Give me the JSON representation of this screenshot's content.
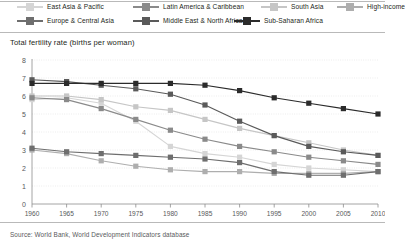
{
  "chart_title": "Total fertility rate (births per woman)",
  "source_note": "Source: World Bank, World Development Indicators database",
  "legend": {
    "items": [
      {
        "label": "East Asia & Pacific",
        "color": "#d5d5d5"
      },
      {
        "label": "Latin America & Caribbean",
        "color": "#8a8a8a"
      },
      {
        "label": "South Asia",
        "color": "#c6c6c6"
      },
      {
        "label": "High-income",
        "color": "#aeaeae"
      },
      {
        "label": "Europe & Central Asia",
        "color": "#6e6e6e"
      },
      {
        "label": "Middle East & North Africa",
        "color": "#5a5a5a"
      },
      {
        "label": "Sub-Saharan Africa",
        "color": "#2b2b2b"
      }
    ]
  },
  "chart_data": {
    "type": "line",
    "title": "Total fertility rate (births per woman)",
    "xlabel": "",
    "ylabel": "Total fertility rate (births per woman)",
    "xlim": [
      1960,
      2010
    ],
    "ylim": [
      0,
      8
    ],
    "yticks": [
      0,
      1,
      2,
      3,
      4,
      5,
      6,
      7,
      8
    ],
    "grid": true,
    "legend_position": "top",
    "x": [
      1960,
      1965,
      1970,
      1975,
      1980,
      1985,
      1990,
      1995,
      2000,
      2005,
      2010
    ],
    "categories": [
      "1960",
      "1965",
      "1970",
      "1975",
      "1980",
      "1985",
      "1990",
      "1995",
      "2000",
      "2005",
      "2010"
    ],
    "series": [
      {
        "name": "East Asia & Pacific",
        "color": "#d5d5d5",
        "values": [
          5.8,
          5.9,
          5.6,
          4.6,
          3.2,
          2.8,
          2.6,
          2.2,
          2.0,
          1.9,
          1.8
        ]
      },
      {
        "name": "Latin America & Caribbean",
        "color": "#8a8a8a",
        "values": [
          5.9,
          5.8,
          5.3,
          4.7,
          4.1,
          3.6,
          3.2,
          2.9,
          2.6,
          2.4,
          2.2
        ]
      },
      {
        "name": "South Asia",
        "color": "#c6c6c6",
        "values": [
          6.0,
          6.0,
          5.8,
          5.4,
          5.2,
          4.7,
          4.2,
          3.8,
          3.4,
          3.0,
          2.7
        ]
      },
      {
        "name": "High-income",
        "color": "#aeaeae",
        "values": [
          3.0,
          2.8,
          2.4,
          2.1,
          1.9,
          1.8,
          1.8,
          1.7,
          1.7,
          1.7,
          1.8
        ]
      },
      {
        "name": "Europe & Central Asia",
        "color": "#6e6e6e",
        "values": [
          3.1,
          2.9,
          2.8,
          2.7,
          2.6,
          2.5,
          2.3,
          1.8,
          1.6,
          1.6,
          1.8
        ]
      },
      {
        "name": "Middle East & North Africa",
        "color": "#5a5a5a",
        "values": [
          6.9,
          6.8,
          6.6,
          6.4,
          6.1,
          5.5,
          4.6,
          3.8,
          3.2,
          2.9,
          2.7
        ]
      },
      {
        "name": "Sub-Saharan Africa",
        "color": "#2b2b2b",
        "values": [
          6.7,
          6.7,
          6.7,
          6.7,
          6.7,
          6.6,
          6.3,
          5.9,
          5.6,
          5.3,
          5.0
        ]
      }
    ]
  }
}
